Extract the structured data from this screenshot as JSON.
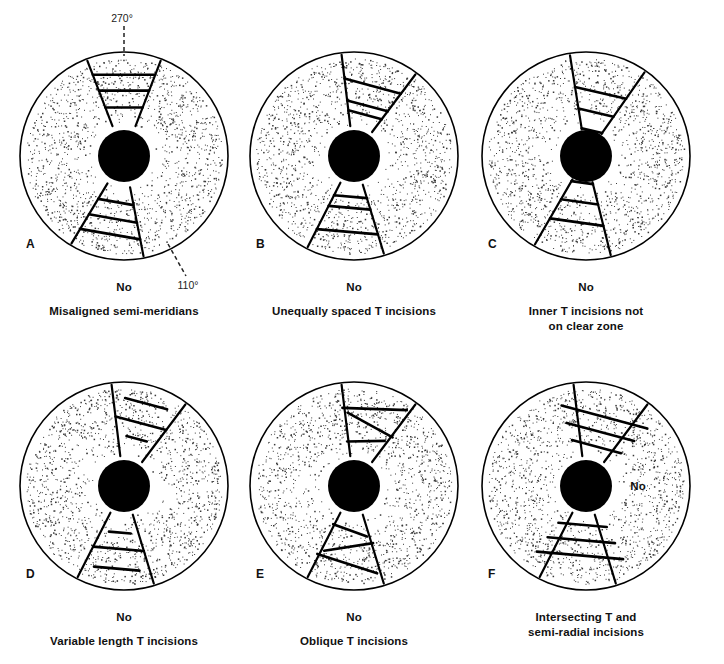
{
  "figure": {
    "type": "medical-illustration",
    "background_color": "#ffffff",
    "ink_color": "#111111",
    "panel_count": 6,
    "columns": 3,
    "rows": 2
  },
  "geometry": {
    "cornea_radius": 104,
    "pupil_radius": 26,
    "stipple_color": "#3a3a3a",
    "pupil_color": "#000000",
    "line_color": "#000000"
  },
  "panels": [
    {
      "letter": "A",
      "verdict": "No",
      "caption": "Misaligned semi-meridians",
      "caption_lines": [
        "Misaligned semi-meridians"
      ],
      "verdict_inside": false,
      "annotations": [
        {
          "label": "270°",
          "position": "top",
          "leader": "dashed-vertical"
        },
        {
          "label": "110°",
          "position": "bottom-right",
          "leader": "dashed-diagonal"
        }
      ],
      "semi_meridians": {
        "upper_center_deg": 270,
        "lower_center_deg": 110,
        "aligned": false
      },
      "t_incisions_upper": 3,
      "t_incisions_lower": 3,
      "fault": "upper and lower semi-meridians are not 180° apart"
    },
    {
      "letter": "B",
      "verdict": "No",
      "caption": "Unequally spaced T incisions",
      "caption_lines": [
        "Unequally spaced T incisions"
      ],
      "verdict_inside": false,
      "annotations": [],
      "t_incisions_upper": 3,
      "t_incisions_lower": 3,
      "fault": "spacing between transverse incisions is irregular"
    },
    {
      "letter": "C",
      "verdict": "No",
      "caption": "Inner T incisions not on clear zone",
      "caption_lines": [
        "Inner T incisions not",
        "on clear zone"
      ],
      "verdict_inside": false,
      "annotations": [],
      "t_incisions_upper": 3,
      "t_incisions_lower": 3,
      "fault": "innermost transverse incisions encroach on the central clear zone"
    },
    {
      "letter": "D",
      "verdict": "No",
      "caption": "Variable length T incisions",
      "caption_lines": [
        "Variable length T incisions"
      ],
      "verdict_inside": false,
      "annotations": [],
      "t_incisions_upper": 3,
      "t_incisions_lower": 3,
      "fault": "transverse incisions differ in length"
    },
    {
      "letter": "E",
      "verdict": "No",
      "caption": "Oblique T incisions",
      "caption_lines": [
        "Oblique T incisions"
      ],
      "verdict_inside": false,
      "annotations": [],
      "t_incisions_upper": 3,
      "t_incisions_lower": 3,
      "fault": "transverse incisions are not perpendicular to the meridian"
    },
    {
      "letter": "F",
      "verdict": "No",
      "caption": "Intersecting T and semi-radial incisions",
      "caption_lines": [
        "Intersecting T and",
        "semi-radial incisions"
      ],
      "verdict_inside": true,
      "annotations": [],
      "t_incisions_upper": 3,
      "t_incisions_lower": 3,
      "fault": "transverse incisions cross the semi-radial incisions"
    }
  ]
}
